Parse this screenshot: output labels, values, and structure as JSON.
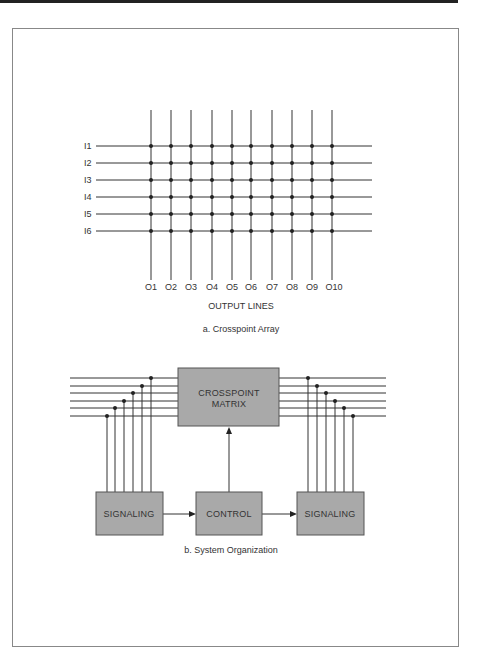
{
  "figure_a": {
    "caption": "a. Crosspoint Array",
    "axis_label": "OUTPUT LINES",
    "input_labels": [
      "I1",
      "I2",
      "I3",
      "I4",
      "I5",
      "I6"
    ],
    "output_labels": [
      "O1",
      "O2",
      "O3",
      "O4",
      "O5",
      "O6",
      "O7",
      "O8",
      "O9",
      "O10"
    ]
  },
  "figure_b": {
    "caption": "b. System Organization",
    "matrix_label_line1": "CROSSPOINT",
    "matrix_label_line2": "MATRIX",
    "left_box": "SIGNALING",
    "control_box": "CONTROL",
    "right_box": "SIGNALING"
  },
  "colors": {
    "line": "#333333",
    "box_fill": "#a9a9a9",
    "box_stroke": "#555555"
  }
}
